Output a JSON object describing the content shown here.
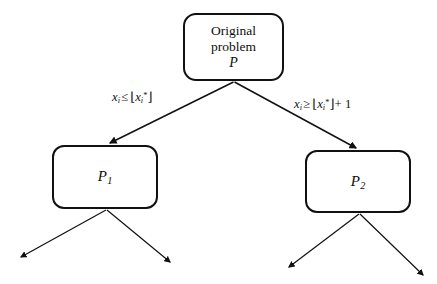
{
  "diagram": {
    "type": "branch-and-bound-tree",
    "background_color": "#ffffff",
    "stroke_color": "#111111",
    "nodes": [
      {
        "id": "root",
        "line1": "Original",
        "line2": "problem",
        "line3": "P"
      },
      {
        "id": "p1",
        "symbol": "P",
        "subscript": "1"
      },
      {
        "id": "p2",
        "symbol": "P",
        "subscript": "2"
      }
    ],
    "edges": {
      "left": {
        "variable": "x",
        "var_subscript": "i",
        "relation": "≤",
        "floor_open": "⌊",
        "floor_var": "x",
        "floor_subscript": "i",
        "floor_superscript": "*",
        "floor_close": "⌋",
        "addend": ""
      },
      "right": {
        "variable": "x",
        "var_subscript": "i",
        "relation": "≥",
        "floor_open": "⌊",
        "floor_var": "x",
        "floor_subscript": "i",
        "floor_superscript": "*",
        "floor_close": "⌋",
        "addend": "+ 1"
      }
    }
  }
}
